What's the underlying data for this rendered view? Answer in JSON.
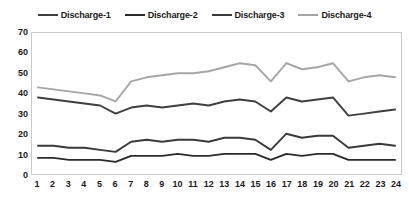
{
  "chart_data": {
    "type": "line",
    "title": "",
    "subtitle": "",
    "xlabel": "",
    "ylabel": "",
    "xlim": [
      1,
      24
    ],
    "ylim": [
      0,
      70
    ],
    "grid": false,
    "legend_position": "top",
    "x": [
      1,
      2,
      3,
      4,
      5,
      6,
      7,
      8,
      9,
      10,
      11,
      12,
      13,
      14,
      15,
      16,
      17,
      18,
      19,
      20,
      21,
      22,
      23,
      24
    ],
    "x_tick_labels": [
      "1",
      "2",
      "3",
      "4",
      "5",
      "6",
      "7",
      "8",
      "9",
      "10",
      "11",
      "12",
      "13",
      "14",
      "15",
      "16",
      "17",
      "18",
      "19",
      "20",
      "21",
      "22",
      "23",
      "24"
    ],
    "y_tick_labels": [
      "0",
      "10",
      "20",
      "30",
      "40",
      "50",
      "60",
      "70"
    ],
    "y_ticks": [
      0,
      10,
      20,
      30,
      40,
      50,
      60,
      70
    ],
    "series": [
      {
        "name": "Discharge-1",
        "color": "#3f3f3f",
        "width": 1.9,
        "values": [
          38,
          37,
          36,
          35,
          34,
          30,
          33,
          34,
          33,
          34,
          35,
          34,
          36,
          37,
          36,
          31,
          38,
          36,
          37,
          38,
          29,
          30,
          31,
          32
        ]
      },
      {
        "name": "Discharge-2",
        "color": "#2b2b2b",
        "width": 1.9,
        "values": [
          8,
          8,
          7,
          7,
          7,
          6,
          9,
          9,
          9,
          10,
          9,
          9,
          10,
          10,
          10,
          7,
          10,
          9,
          10,
          10,
          7,
          7,
          7,
          7
        ]
      },
      {
        "name": "Discharge-3",
        "color": "#3a3a3a",
        "width": 1.9,
        "values": [
          14,
          14,
          13,
          13,
          12,
          11,
          16,
          17,
          16,
          17,
          17,
          16,
          18,
          18,
          17,
          12,
          20,
          18,
          19,
          19,
          13,
          14,
          15,
          14
        ]
      },
      {
        "name": "Discharge-4",
        "color": "#a6a6a6",
        "width": 1.9,
        "values": [
          43,
          42,
          41,
          40,
          39,
          36,
          46,
          48,
          49,
          50,
          50,
          51,
          53,
          55,
          54,
          46,
          55,
          52,
          53,
          55,
          46,
          48,
          49,
          48
        ]
      }
    ]
  }
}
